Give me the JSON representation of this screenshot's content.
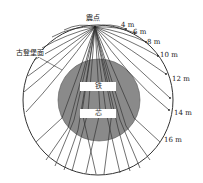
{
  "diagram": {
    "epicenter_label": "震点",
    "discontinuity_label": "古登堡面",
    "core_labels": [
      "铁",
      "芯"
    ],
    "distance_labels": [
      "4 m",
      "6 m",
      "8 m",
      "10 m",
      "12 m",
      "14 m",
      "16 m"
    ],
    "colors": {
      "background": "#ffffff",
      "line": "#333333",
      "core_fill": "#8a8a8a"
    }
  }
}
